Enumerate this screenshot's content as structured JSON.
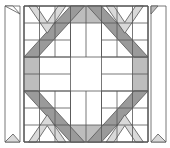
{
  "diagram": {
    "title": "",
    "type": "quilt-block-pattern",
    "colors": {
      "background": "#ffffff",
      "line": "#555555",
      "dark": "#9a9a9a",
      "medium": "#bdbdbd",
      "light": "#d9d9d9",
      "white": "#ffffff"
    },
    "elements": [
      {
        "name": "left-border-strip",
        "fill": "white"
      },
      {
        "name": "right-border-strip",
        "fill": "white"
      },
      {
        "name": "octagon-band",
        "fill": "dark"
      },
      {
        "name": "center-cross",
        "fill": "white"
      },
      {
        "name": "corner-chevrons",
        "fill": "light"
      },
      {
        "name": "side-rectangles",
        "fill": "medium"
      }
    ]
  }
}
